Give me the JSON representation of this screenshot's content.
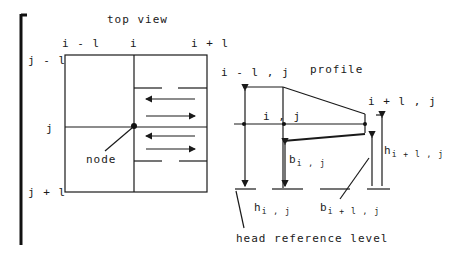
{
  "top_view": {
    "title": "top view",
    "col_labels": [
      "i - l",
      "i",
      "i + l"
    ],
    "row_labels": [
      "j - l",
      "j",
      "j + l"
    ],
    "node_label": "node"
  },
  "profile": {
    "title": "profile",
    "point_labels": {
      "left": "i - l , j",
      "center": "i , j",
      "right": "i + l , j"
    },
    "b_ij": {
      "base": "b",
      "sub": "i , j"
    },
    "h_ij": {
      "base": "h",
      "sub": "i , j"
    },
    "b_i1j": {
      "base": "b",
      "sub": "i + l , j"
    },
    "h_i1j": {
      "base": "h",
      "sub": "i + l , j"
    },
    "reference_label": "head reference level"
  },
  "colors": {
    "ink": "#1a1a1a",
    "background": "#ffffff"
  }
}
